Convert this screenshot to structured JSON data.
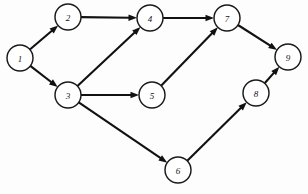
{
  "diagram": {
    "type": "directed-graph",
    "canvas": {
      "width": 308,
      "height": 194,
      "background": "#fdfdfd"
    },
    "style": {
      "node_radius": 13,
      "node_fill": "#ffffff",
      "node_stroke": "#1a1a1a",
      "node_stroke_width": 1.45,
      "edge_color": "#111111",
      "edge_width": 2.1,
      "label_color": "#151515",
      "label_size": 9,
      "arrow_length": 8.5,
      "arrow_half_width": 3.2
    },
    "nodes": [
      {
        "id": "1",
        "label": "1",
        "x": 20,
        "y": 58
      },
      {
        "id": "2",
        "label": "2",
        "x": 68,
        "y": 17
      },
      {
        "id": "3",
        "label": "3",
        "x": 68,
        "y": 95
      },
      {
        "id": "4",
        "label": "4",
        "x": 150,
        "y": 18
      },
      {
        "id": "5",
        "label": "5",
        "x": 152,
        "y": 95
      },
      {
        "id": "6",
        "label": "6",
        "x": 178,
        "y": 170
      },
      {
        "id": "7",
        "label": "7",
        "x": 227,
        "y": 18
      },
      {
        "id": "8",
        "label": "8",
        "x": 256,
        "y": 93
      },
      {
        "id": "9",
        "label": "9",
        "x": 288,
        "y": 57
      }
    ],
    "edges": [
      {
        "from": "1",
        "to": "2",
        "directed": true
      },
      {
        "from": "1",
        "to": "3",
        "directed": true
      },
      {
        "from": "2",
        "to": "4",
        "directed": true
      },
      {
        "from": "3",
        "to": "4",
        "directed": true
      },
      {
        "from": "3",
        "to": "5",
        "directed": true
      },
      {
        "from": "3",
        "to": "6",
        "directed": true
      },
      {
        "from": "4",
        "to": "7",
        "directed": true
      },
      {
        "from": "5",
        "to": "7",
        "directed": true
      },
      {
        "from": "6",
        "to": "8",
        "directed": true
      },
      {
        "from": "7",
        "to": "9",
        "directed": true
      },
      {
        "from": "8",
        "to": "9",
        "directed": true
      }
    ]
  }
}
